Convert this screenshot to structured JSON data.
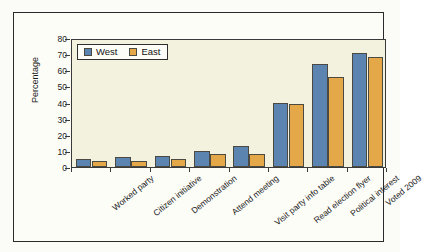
{
  "chart_data": {
    "type": "bar",
    "title": "",
    "subtitle": "",
    "xlabel": "",
    "ylabel": "Percentage",
    "ylim": [
      0,
      80
    ],
    "yticks": [
      0,
      10,
      20,
      30,
      40,
      50,
      60,
      70,
      80
    ],
    "ytick_labels": [
      "0",
      "10",
      "20",
      "30",
      "40",
      "50",
      "60",
      "70",
      "80"
    ],
    "grid": false,
    "legend_position": "upper left",
    "categories": [
      "Worked party",
      "Citizen initiative",
      "Demonstration",
      "Attend meeting",
      "Visit party info table",
      "Read election flyer",
      "Political interest",
      "Voted 2009"
    ],
    "series": [
      {
        "name": "West",
        "color": "#5c84b1",
        "values": [
          5,
          6,
          7,
          10,
          13,
          40,
          64,
          71
        ]
      },
      {
        "name": "East",
        "color": "#e5a849",
        "values": [
          4,
          4,
          5,
          8,
          8,
          39,
          56,
          68
        ]
      }
    ]
  },
  "legend": {
    "entries": [
      {
        "label": "West",
        "color": "#5c84b1"
      },
      {
        "label": "East",
        "color": "#e5a849"
      }
    ]
  },
  "colors": {
    "west": "#5c84b1",
    "east": "#e5a849",
    "plot_background": "#f2f2df",
    "figure_background": "#fdfdf8",
    "axis": "#3a3a3a"
  }
}
